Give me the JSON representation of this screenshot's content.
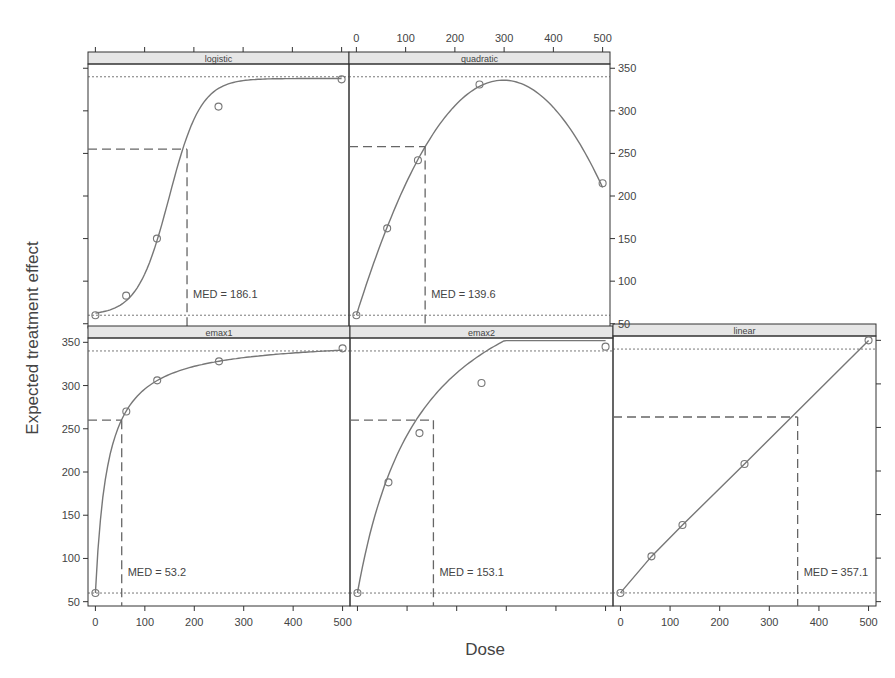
{
  "chart_data": {
    "type": "line",
    "layout": "trellis 2x3 (lattice), top-right slot empty-shifted",
    "xlabel": "Dose",
    "ylabel": "Expected treatment effect",
    "xlim": [
      0,
      500
    ],
    "ylim": [
      50,
      350
    ],
    "x_ticks": [
      0,
      100,
      200,
      300,
      400,
      500
    ],
    "y_ticks": [
      50,
      100,
      150,
      200,
      250,
      300,
      350
    ],
    "grid": false,
    "legend": null,
    "doses": [
      0,
      62.5,
      125,
      250,
      500
    ],
    "reference_lines": {
      "placebo_level_dotted": 60,
      "max_level_dotted": 340
    },
    "panels": [
      {
        "name": "logistic",
        "points": [
          [
            0,
            60
          ],
          [
            62.5,
            83
          ],
          [
            125,
            150
          ],
          [
            250,
            305
          ],
          [
            500,
            337
          ]
        ],
        "med": 186.1,
        "med_label": "MED = 186.1",
        "med_effect": 255
      },
      {
        "name": "quadratic",
        "points": [
          [
            0,
            60
          ],
          [
            62.5,
            162
          ],
          [
            125,
            242
          ],
          [
            250,
            331
          ],
          [
            500,
            215
          ]
        ],
        "med": 139.6,
        "med_label": "MED = 139.6",
        "med_effect": 258
      },
      {
        "name": "emax1",
        "points": [
          [
            0,
            60
          ],
          [
            62.5,
            270
          ],
          [
            125,
            306
          ],
          [
            250,
            328
          ],
          [
            500,
            343
          ]
        ],
        "med": 53.2,
        "med_label": "MED = 53.2",
        "med_effect": 260
      },
      {
        "name": "emax2",
        "points": [
          [
            0,
            60
          ],
          [
            62.5,
            188
          ],
          [
            125,
            245
          ],
          [
            250,
            303
          ],
          [
            500,
            345
          ]
        ],
        "med": 153.1,
        "med_label": "MED = 153.1",
        "med_effect": 260
      },
      {
        "name": "linear",
        "points": [
          [
            0,
            60
          ],
          [
            62.5,
            102
          ],
          [
            125,
            138
          ],
          [
            250,
            208
          ],
          [
            500,
            350
          ]
        ],
        "med": 357.1,
        "med_label": "MED = 357.1",
        "med_effect": 262
      }
    ]
  },
  "labels": {
    "xlabel": "Dose",
    "ylabel": "Expected treatment effect"
  },
  "colors": {
    "curve": "#777777",
    "frame": "#333333",
    "strip": "#e6e6e6",
    "text": "#444444"
  }
}
